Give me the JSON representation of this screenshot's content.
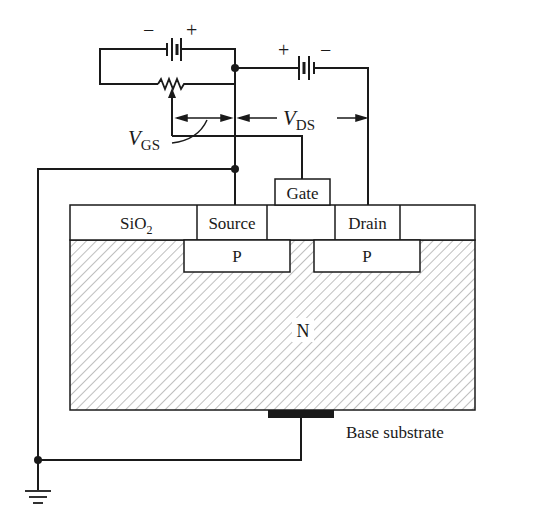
{
  "diagram": {
    "type": "p-channel enhancement MOSFET cross-section with bias circuit",
    "colors": {
      "ink": "#1a1a1a",
      "hatch": "#8a8a8a",
      "background": "#ffffff"
    },
    "battery_gs": {
      "polarity_left": "−",
      "polarity_right": "+"
    },
    "battery_ds": {
      "polarity_left": "+",
      "polarity_right": "−"
    },
    "labels": {
      "vgs_main": "V",
      "vgs_sub": "GS",
      "vds_main": "V",
      "vds_sub": "DS",
      "gate": "Gate",
      "sio2_main": "SiO",
      "sio2_sub": "2",
      "source": "Source",
      "drain": "Drain",
      "p_left": "P",
      "p_right": "P",
      "n_body": "N",
      "base_substrate": "Base substrate"
    }
  }
}
